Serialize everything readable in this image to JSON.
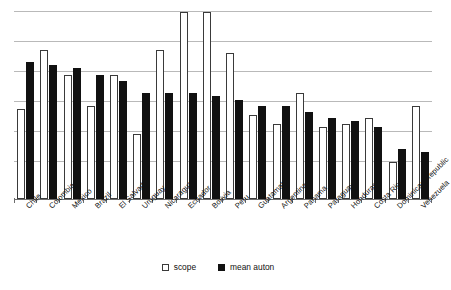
{
  "chart_data": {
    "type": "bar",
    "title": "",
    "xlabel": "",
    "ylabel": "",
    "ylim": [
      0,
      6.4
    ],
    "grid": true,
    "gridline_values": [
      6.3,
      5.3,
      4.3,
      3.3,
      2.3,
      1.3
    ],
    "legend_position": "bottom-center",
    "categories": [
      "Chile",
      "Colombia",
      "Mexico",
      "Brazil",
      "El Salvador",
      "Uruguay",
      "Nicaragua",
      "Ecuador",
      "Bolivia",
      "Peru",
      "Guatamala",
      "Argentina",
      "Panama",
      "Paraguay",
      "Honduras",
      "Costa Rica",
      "Dominican Republic",
      "Venezuela"
    ],
    "series": [
      {
        "name": "scope",
        "color": "#ffffff",
        "values": [
          2.9,
          4.8,
          4.0,
          3.0,
          4.0,
          2.1,
          4.8,
          6.0,
          6.0,
          4.7,
          2.7,
          2.4,
          3.4,
          2.3,
          2.4,
          2.6,
          1.2,
          3.0
        ]
      },
      {
        "name": "mean auton",
        "color": "#111111",
        "values": [
          4.4,
          4.3,
          4.2,
          4.0,
          3.8,
          3.4,
          3.4,
          3.4,
          3.3,
          3.2,
          3.0,
          3.0,
          2.8,
          2.6,
          2.5,
          2.3,
          1.6,
          1.5
        ]
      }
    ]
  },
  "legend": {
    "items": [
      {
        "label": "scope",
        "swatch": "hollow-square"
      },
      {
        "label": "mean auton",
        "swatch": "filled-square"
      }
    ]
  },
  "colors": {
    "scope_fill": "#ffffff",
    "scope_border": "#3a3a3a",
    "auton_fill": "#111111",
    "gridline": "#b9b9b9",
    "axis": "#6d6d6d",
    "text": "#111111",
    "background": "#ffffff"
  }
}
